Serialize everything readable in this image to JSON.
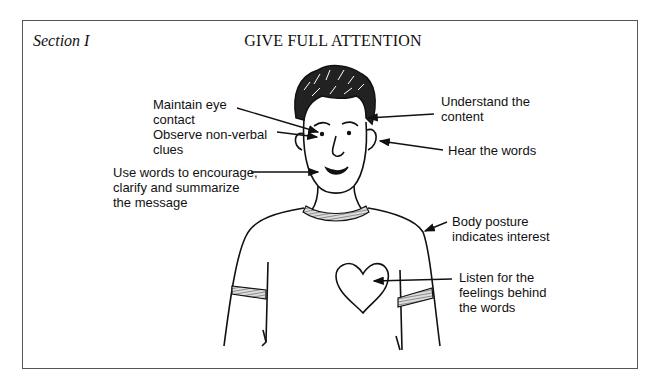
{
  "header": {
    "section": "Section I",
    "title": "GIVE FULL ATTENTION"
  },
  "labels": {
    "eye_contact": "Maintain eye\ncontact",
    "nonverbal": "Observe non-verbal\nclues",
    "encourage": "Use words to encourage,\nclarify and summarize\nthe message",
    "understand": "Understand the\ncontent",
    "hear": "Hear the words",
    "posture": "Body posture\nindicates interest",
    "feelings": "Listen for the\nfeelings behind\nthe words"
  },
  "colors": {
    "ink": "#111111",
    "frame": "#555555",
    "background": "#ffffff"
  }
}
